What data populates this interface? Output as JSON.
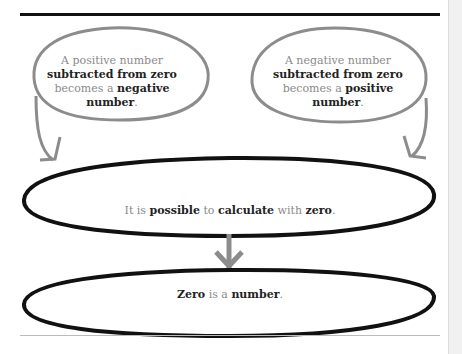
{
  "diagram": {
    "left_bubble": {
      "parts": [
        {
          "text": "A positive number",
          "bold": false
        },
        {
          "text": "subtracted from zero",
          "bold": true
        },
        {
          "text": "becomes a ",
          "bold": false
        },
        {
          "text": "negative",
          "bold": true
        },
        {
          "text": "number",
          "bold": true
        },
        {
          "text": ".",
          "bold": false
        }
      ]
    },
    "right_bubble": {
      "parts": [
        {
          "text": "A negative number",
          "bold": false
        },
        {
          "text": "subtracted from zero",
          "bold": true
        },
        {
          "text": "becomes a ",
          "bold": false
        },
        {
          "text": "positive",
          "bold": true
        },
        {
          "text": "number",
          "bold": true
        },
        {
          "text": ".",
          "bold": false
        }
      ]
    },
    "middle_ellipse": {
      "parts": [
        {
          "text": "It is ",
          "bold": false
        },
        {
          "text": "possible",
          "bold": true
        },
        {
          "text": " to ",
          "bold": false
        },
        {
          "text": "calculate",
          "bold": true
        },
        {
          "text": " with ",
          "bold": false
        },
        {
          "text": "zero",
          "bold": true
        },
        {
          "text": ".",
          "bold": false
        }
      ]
    },
    "bottom_ellipse": {
      "parts": [
        {
          "text": "Zero",
          "bold": true
        },
        {
          "text": " is a ",
          "bold": false
        },
        {
          "text": "number",
          "bold": true
        },
        {
          "text": ".",
          "bold": false
        }
      ]
    },
    "colors": {
      "bubble_stroke": "#8c8c8c",
      "ellipse_stroke": "#111111",
      "arrow": "#8c8c8c",
      "plain_text": "#8a8a8a",
      "bold_text": "#222222"
    }
  }
}
